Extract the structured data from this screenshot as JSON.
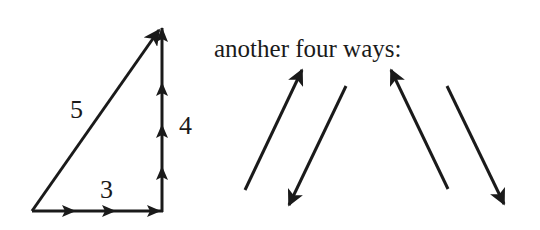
{
  "triangle": {
    "hypotenuse_label": "5",
    "vertical_label": "4",
    "horizontal_label": "3"
  },
  "caption": "another four ways:",
  "colors": {
    "stroke": "#1a1a1a",
    "background": "#ffffff"
  },
  "arrows": [
    {
      "name": "arrow-up-right",
      "from": [
        245,
        190
      ],
      "to": [
        302,
        70
      ]
    },
    {
      "name": "arrow-down-left",
      "from": [
        346,
        86
      ],
      "to": [
        289,
        205
      ]
    },
    {
      "name": "arrow-up-left",
      "from": [
        448,
        189
      ],
      "to": [
        391,
        70
      ]
    },
    {
      "name": "arrow-down-right",
      "from": [
        447,
        86
      ],
      "to": [
        504,
        204
      ]
    }
  ]
}
